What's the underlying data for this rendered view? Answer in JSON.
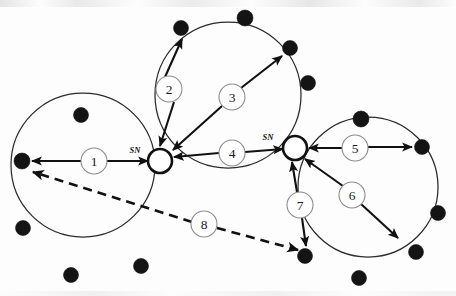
{
  "figure": {
    "type": "network-topology-diagram",
    "width": 456,
    "height": 296,
    "background_color": "#ffffff",
    "ink_color": "#111111",
    "ring_stroke_color": "#2b2b2b",
    "label_outline_color": "#8d8d8d"
  },
  "rings": [
    {
      "id": "ring-left",
      "name": "left-ring",
      "cx": 83,
      "cy": 165,
      "r": 72
    },
    {
      "id": "ring-top",
      "name": "top-ring",
      "cx": 228,
      "cy": 95,
      "r": 73
    },
    {
      "id": "ring-right",
      "name": "right-ring",
      "cx": 368,
      "cy": 187,
      "r": 70
    }
  ],
  "super_nodes": [
    {
      "id": "sn-left",
      "label": "SN",
      "cx": 160,
      "cy": 161,
      "r": 12,
      "label_x": 135,
      "label_y": 150
    },
    {
      "id": "sn-right",
      "label": "SN",
      "cx": 295,
      "cy": 148,
      "r": 12,
      "label_x": 268,
      "label_y": 137
    }
  ],
  "peer_nodes": [
    {
      "id": "p-l1",
      "ring": "left",
      "cx": 81,
      "cy": 115,
      "r": 7.5
    },
    {
      "id": "p-l2",
      "ring": "left",
      "cx": 22,
      "cy": 161,
      "r": 8.0
    },
    {
      "id": "p-l3",
      "ring": "left",
      "cx": 23,
      "cy": 228,
      "r": 7.5
    },
    {
      "id": "p-l4",
      "ring": "left",
      "cx": 71,
      "cy": 275,
      "r": 7.5
    },
    {
      "id": "p-l5",
      "ring": "left",
      "cx": 141,
      "cy": 266,
      "r": 7.5
    },
    {
      "id": "p-t1",
      "ring": "top",
      "cx": 181,
      "cy": 28,
      "r": 7.5
    },
    {
      "id": "p-t2",
      "ring": "top",
      "cx": 245,
      "cy": 18,
      "r": 8.0
    },
    {
      "id": "p-t3",
      "ring": "top",
      "cx": 290,
      "cy": 48,
      "r": 7.5
    },
    {
      "id": "p-t4",
      "ring": "top",
      "cx": 308,
      "cy": 83,
      "r": 7.5
    },
    {
      "id": "p-r1",
      "ring": "right",
      "cx": 361,
      "cy": 119,
      "r": 8.0
    },
    {
      "id": "p-r2",
      "ring": "right",
      "cx": 422,
      "cy": 147,
      "r": 7.5
    },
    {
      "id": "p-r3",
      "ring": "right",
      "cx": 438,
      "cy": 213,
      "r": 7.5
    },
    {
      "id": "p-r4",
      "ring": "right",
      "cx": 416,
      "cy": 252,
      "r": 7.5
    },
    {
      "id": "p-r5",
      "ring": "right",
      "cx": 359,
      "cy": 278,
      "r": 7.5
    },
    {
      "id": "p-r6",
      "ring": "right",
      "cx": 305,
      "cy": 256,
      "r": 7.5
    }
  ],
  "edges": [
    {
      "label": "1",
      "style": "solid",
      "label_cx": 94,
      "label_cy": 161,
      "label_r": 13,
      "segments": [
        {
          "x1": 81,
          "y1": 161,
          "x2": 32,
          "y2": 161,
          "arrow_end": true
        },
        {
          "x1": 107,
          "y1": 161,
          "x2": 148,
          "y2": 161,
          "arrow_end": true
        }
      ]
    },
    {
      "label": "2",
      "style": "solid",
      "label_cx": 169,
      "label_cy": 89,
      "label_r": 13,
      "segments": [
        {
          "x1": 165,
          "y1": 77,
          "x2": 182,
          "y2": 39,
          "arrow_end": true
        },
        {
          "x1": 174,
          "y1": 102,
          "x2": 160,
          "y2": 146,
          "arrow_end": true
        }
      ]
    },
    {
      "label": "3",
      "style": "solid",
      "label_cx": 232,
      "label_cy": 97,
      "label_r": 13,
      "segments": [
        {
          "x1": 241,
          "y1": 88,
          "x2": 282,
          "y2": 56,
          "arrow_end": true
        },
        {
          "x1": 222,
          "y1": 106,
          "x2": 173,
          "y2": 150,
          "arrow_end": true
        }
      ]
    },
    {
      "label": "4",
      "style": "solid",
      "label_cx": 232,
      "label_cy": 153,
      "label_r": 13,
      "segments": [
        {
          "x1": 219,
          "y1": 153,
          "x2": 174,
          "y2": 157,
          "arrow_end": true
        },
        {
          "x1": 245,
          "y1": 152,
          "x2": 283,
          "y2": 149,
          "arrow_end": true
        }
      ]
    },
    {
      "label": "5",
      "style": "solid",
      "label_cx": 355,
      "label_cy": 148,
      "label_r": 13,
      "segments": [
        {
          "x1": 342,
          "y1": 148,
          "x2": 309,
          "y2": 148,
          "arrow_end": true
        },
        {
          "x1": 368,
          "y1": 147,
          "x2": 412,
          "y2": 147,
          "arrow_end": true
        }
      ]
    },
    {
      "label": "6",
      "style": "solid",
      "label_cx": 352,
      "label_cy": 195,
      "label_r": 13,
      "segments": [
        {
          "x1": 343,
          "y1": 186,
          "x2": 305,
          "y2": 159,
          "arrow_end": true
        },
        {
          "x1": 361,
          "y1": 204,
          "x2": 398,
          "y2": 238,
          "arrow_end": true
        }
      ]
    },
    {
      "label": "7",
      "style": "solid",
      "label_cx": 300,
      "label_cy": 205,
      "label_r": 13,
      "segments": [
        {
          "x1": 297,
          "y1": 192,
          "x2": 292,
          "y2": 162,
          "arrow_end": true
        },
        {
          "x1": 302,
          "y1": 218,
          "x2": 306,
          "y2": 246,
          "arrow_end": true
        }
      ]
    },
    {
      "label": "8",
      "style": "dashed",
      "label_cx": 204,
      "label_cy": 224,
      "label_r": 13,
      "segments": [
        {
          "x1": 192,
          "y1": 222,
          "x2": 33,
          "y2": 172,
          "arrow_end": true
        },
        {
          "x1": 217,
          "y1": 228,
          "x2": 298,
          "y2": 250,
          "arrow_end": true
        }
      ]
    }
  ]
}
